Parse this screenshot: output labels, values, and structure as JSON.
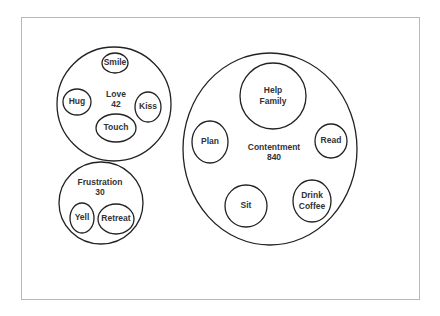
{
  "diagram": {
    "groups": [
      {
        "id": "love",
        "label": "Love",
        "value": "42",
        "cx": 114,
        "cy": 104,
        "rx": 57,
        "ry": 57,
        "label_x": 116,
        "label_y": 95,
        "value_y": 105,
        "items": [
          {
            "label": "Smile",
            "cx": 115,
            "cy": 63,
            "rx": 13,
            "ry": 10
          },
          {
            "label": "Hug",
            "cx": 77,
            "cy": 102,
            "rx": 14,
            "ry": 13
          },
          {
            "label": "Kiss",
            "cx": 148,
            "cy": 107,
            "rx": 13,
            "ry": 15
          },
          {
            "label": "Touch",
            "cx": 116,
            "cy": 128,
            "rx": 20,
            "ry": 14
          }
        ]
      },
      {
        "id": "frustration",
        "label": "Frustration",
        "value": "30",
        "cx": 101,
        "cy": 203,
        "rx": 42,
        "ry": 41,
        "label_x": 100,
        "label_y": 183,
        "value_y": 193,
        "items": [
          {
            "label": "Yell",
            "cx": 82,
            "cy": 218,
            "rx": 12,
            "ry": 15
          },
          {
            "label": "Retreat",
            "cx": 116,
            "cy": 219,
            "rx": 18,
            "ry": 15
          }
        ]
      },
      {
        "id": "contentment",
        "label": "Contentment",
        "value": "840",
        "cx": 270,
        "cy": 149,
        "rx": 87,
        "ry": 96,
        "label_x": 274,
        "label_y": 148,
        "value_y": 158,
        "items": [
          {
            "label": "Help Family",
            "lines": [
              "Help",
              "Family"
            ],
            "cx": 273,
            "cy": 96,
            "rx": 33,
            "ry": 33
          },
          {
            "label": "Plan",
            "cx": 210,
            "cy": 142,
            "rx": 18,
            "ry": 21
          },
          {
            "label": "Read",
            "cx": 331,
            "cy": 141,
            "rx": 16,
            "ry": 17
          },
          {
            "label": "Sit",
            "cx": 246,
            "cy": 206,
            "rx": 21,
            "ry": 21
          },
          {
            "label": "Drink Coffee",
            "lines": [
              "Drink",
              "Coffee"
            ],
            "cx": 312,
            "cy": 201,
            "rx": 19,
            "ry": 21
          }
        ]
      }
    ]
  }
}
